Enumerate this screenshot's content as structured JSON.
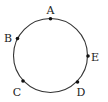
{
  "diagram": {
    "type": "circle-with-points",
    "circle": {
      "cx": 50.5,
      "cy": 55.5,
      "r": 37,
      "stroke": "#333333"
    },
    "points": [
      {
        "id": "A",
        "label": "A",
        "x": 50.5,
        "y": 18.8,
        "lx": 50.5,
        "ly": 14
      },
      {
        "id": "B",
        "label": "B",
        "x": 17.5,
        "y": 38.5,
        "lx": 8,
        "ly": 42
      },
      {
        "id": "E",
        "label": "E",
        "x": 88,
        "y": 56,
        "lx": 95,
        "ly": 61
      },
      {
        "id": "C",
        "label": "C",
        "x": 23,
        "y": 81,
        "lx": 17,
        "ly": 96
      },
      {
        "id": "D",
        "label": "D",
        "x": 77.5,
        "y": 82,
        "lx": 81,
        "ly": 96
      }
    ]
  }
}
